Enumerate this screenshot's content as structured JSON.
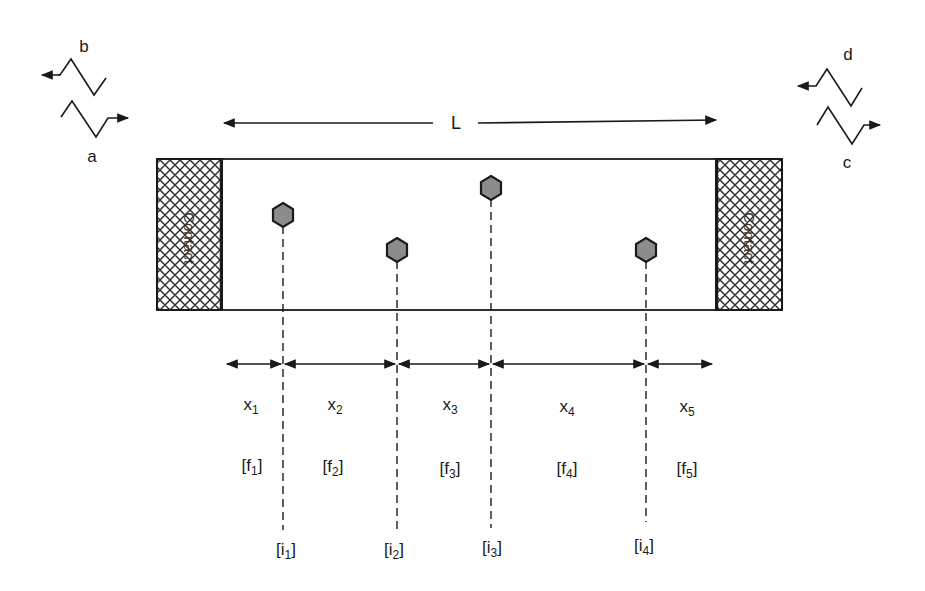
{
  "diagram": {
    "length_label": "L",
    "contacts": [
      {
        "label": "Contact",
        "side": "left"
      },
      {
        "label": "Contact",
        "side": "right"
      }
    ],
    "waves": [
      {
        "label": "a",
        "direction": "right",
        "side": "left"
      },
      {
        "label": "b",
        "direction": "left",
        "side": "left"
      },
      {
        "label": "c",
        "direction": "right",
        "side": "right"
      },
      {
        "label": "d",
        "direction": "left",
        "side": "right"
      }
    ],
    "segments": [
      {
        "x": "x",
        "x_sub": "1",
        "f": "[f",
        "f_sub": "1",
        "f_end": "]"
      },
      {
        "x": "x",
        "x_sub": "2",
        "f": "[f",
        "f_sub": "2",
        "f_end": "]"
      },
      {
        "x": "x",
        "x_sub": "3",
        "f": "[f",
        "f_sub": "3",
        "f_end": "]"
      },
      {
        "x": "x",
        "x_sub": "4",
        "f": "[f",
        "f_sub": "4",
        "f_end": "]"
      },
      {
        "x": "x",
        "x_sub": "5",
        "f": "[f",
        "f_sub": "5",
        "f_end": "]"
      }
    ],
    "impurities": [
      {
        "label": "[i",
        "sub": "1",
        "end": "]"
      },
      {
        "label": "[i",
        "sub": "2",
        "end": "]"
      },
      {
        "label": "[i",
        "sub": "3",
        "end": "]"
      },
      {
        "label": "[i",
        "sub": "4",
        "end": "]"
      }
    ],
    "colors": {
      "line": "#1a1a1a",
      "scatterer_fill": "#8c8c8c",
      "hatch": "#2a2a2a"
    }
  }
}
